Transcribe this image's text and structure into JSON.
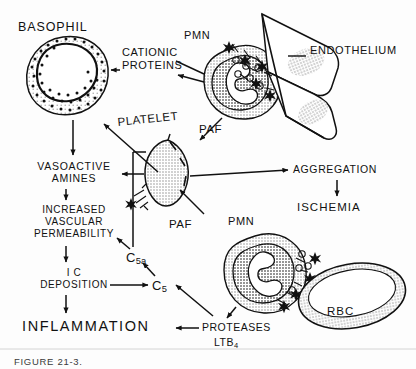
{
  "figure": {
    "caption": "FIGURE 21-3.",
    "background_color": "#fdfdfd",
    "ink_color": "#111111",
    "fill_color": "#d8d8d8"
  },
  "cells": [
    {
      "name": "basophil",
      "label": "BASOPHIL"
    },
    {
      "name": "pmn-endothelium",
      "label": "PMN"
    },
    {
      "name": "endothelium",
      "label": "ENDOTHELIUM"
    },
    {
      "name": "platelet",
      "label": "PLATELET"
    },
    {
      "name": "pmn-rbc",
      "label": "PMN"
    },
    {
      "name": "rbc",
      "label": "RBC"
    }
  ],
  "mediators": [
    {
      "name": "cationic-proteins",
      "label": "CATIONIC\nPROTEINS"
    },
    {
      "name": "paf-platelet",
      "label": "PAF"
    },
    {
      "name": "paf-pmn",
      "label": "PAF"
    },
    {
      "name": "c5a",
      "label": "C",
      "subscript": "5a"
    },
    {
      "name": "c5",
      "label": "C",
      "subscript": "5"
    },
    {
      "name": "proteases",
      "label": "PROTEASES"
    },
    {
      "name": "ltb4",
      "label": "LTB",
      "subscript": "4"
    }
  ],
  "cascade": [
    {
      "name": "vasoactive-amines",
      "label": "VASOACTIVE\nAMINES"
    },
    {
      "name": "increased-vascular-permeability",
      "label": "INCREASED\nVASCULAR\nPERMEABILITY"
    },
    {
      "name": "ic-deposition",
      "label": "I C\nDEPOSITION"
    },
    {
      "name": "inflammation",
      "label": "INFLAMMATION"
    }
  ],
  "outcomes": [
    {
      "name": "aggregation",
      "label": "AGGREGATION"
    },
    {
      "name": "ischemia",
      "label": "ISCHEMIA"
    }
  ]
}
